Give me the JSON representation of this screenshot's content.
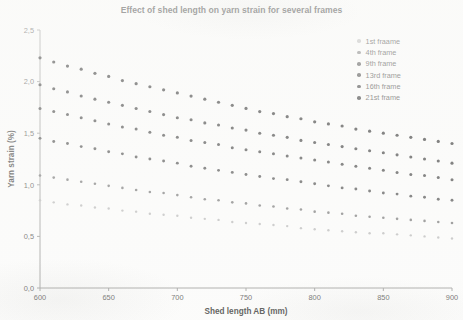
{
  "chart_data": {
    "type": "scatter",
    "title": "Effect of shed length on yarn strain for several frames",
    "xlabel": "Shed length AB (mm)",
    "ylabel": "Yarn strain (%)",
    "xlim": [
      600,
      900
    ],
    "ylim": [
      0.0,
      2.5
    ],
    "xticks": [
      "600",
      "650",
      "700",
      "750",
      "800",
      "850",
      "900"
    ],
    "xtick_values": [
      600,
      650,
      700,
      750,
      800,
      850,
      900
    ],
    "yticks": [
      "0,0",
      "0,5",
      "1,0",
      "1,5",
      "2,0",
      "2,5"
    ],
    "ytick_values": [
      0.0,
      0.5,
      1.0,
      1.5,
      2.0,
      2.5
    ],
    "grid": false,
    "legend_position": "top-right",
    "decimal_separator": ",",
    "marker": "circle",
    "x": [
      600,
      610,
      620,
      630,
      640,
      650,
      660,
      670,
      680,
      690,
      700,
      710,
      720,
      730,
      740,
      750,
      760,
      770,
      780,
      790,
      800,
      810,
      820,
      830,
      840,
      850,
      860,
      870,
      880,
      890,
      900
    ],
    "series": [
      {
        "name": "21st frame",
        "color": "#2a2a2a",
        "marker_size": 3.2,
        "values": [
          2.23,
          2.19,
          2.15,
          2.12,
          2.08,
          2.05,
          2.01,
          1.98,
          1.95,
          1.92,
          1.89,
          1.86,
          1.83,
          1.8,
          1.77,
          1.74,
          1.71,
          1.69,
          1.66,
          1.64,
          1.61,
          1.59,
          1.57,
          1.54,
          1.52,
          1.5,
          1.48,
          1.46,
          1.44,
          1.42,
          1.4
        ]
      },
      {
        "name": "16th frame",
        "color": "#343434",
        "marker_size": 3.1,
        "values": [
          1.97,
          1.93,
          1.9,
          1.86,
          1.83,
          1.8,
          1.77,
          1.74,
          1.71,
          1.68,
          1.65,
          1.63,
          1.6,
          1.58,
          1.55,
          1.53,
          1.5,
          1.48,
          1.46,
          1.43,
          1.41,
          1.39,
          1.37,
          1.35,
          1.33,
          1.31,
          1.29,
          1.27,
          1.25,
          1.23,
          1.21
        ]
      },
      {
        "name": "13rd frame",
        "color": "#3d3d3d",
        "marker_size": 3.0,
        "values": [
          1.74,
          1.71,
          1.68,
          1.65,
          1.62,
          1.59,
          1.56,
          1.54,
          1.51,
          1.48,
          1.46,
          1.43,
          1.41,
          1.39,
          1.36,
          1.34,
          1.32,
          1.3,
          1.28,
          1.26,
          1.24,
          1.22,
          1.2,
          1.18,
          1.16,
          1.14,
          1.12,
          1.1,
          1.09,
          1.07,
          1.05
        ]
      },
      {
        "name": "9th frame",
        "color": "#4a4a4a",
        "marker_size": 2.9,
        "values": [
          1.45,
          1.42,
          1.4,
          1.37,
          1.35,
          1.32,
          1.3,
          1.27,
          1.25,
          1.23,
          1.21,
          1.18,
          1.16,
          1.14,
          1.12,
          1.1,
          1.08,
          1.06,
          1.05,
          1.03,
          1.01,
          0.99,
          0.97,
          0.96,
          0.94,
          0.92,
          0.91,
          0.89,
          0.88,
          0.86,
          0.85
        ]
      },
      {
        "name": "4th frame",
        "color": "#777777",
        "marker_size": 2.6,
        "values": [
          1.09,
          1.07,
          1.05,
          1.03,
          1.01,
          0.99,
          0.97,
          0.95,
          0.93,
          0.92,
          0.9,
          0.88,
          0.86,
          0.85,
          0.83,
          0.82,
          0.8,
          0.79,
          0.77,
          0.76,
          0.74,
          0.73,
          0.72,
          0.7,
          0.69,
          0.68,
          0.67,
          0.66,
          0.65,
          0.64,
          0.63
        ]
      },
      {
        "name": "1st fraame",
        "color": "#b9b9b9",
        "marker_size": 2.4,
        "values": [
          0.85,
          0.83,
          0.81,
          0.8,
          0.78,
          0.77,
          0.75,
          0.74,
          0.72,
          0.71,
          0.7,
          0.68,
          0.67,
          0.66,
          0.64,
          0.63,
          0.62,
          0.61,
          0.6,
          0.58,
          0.57,
          0.56,
          0.55,
          0.54,
          0.53,
          0.53,
          0.52,
          0.51,
          0.5,
          0.49,
          0.48
        ]
      }
    ]
  },
  "legend": {
    "items": [
      {
        "label": "1st fraame",
        "color": "#b9b9b9"
      },
      {
        "label": "4th frame",
        "color": "#777777"
      },
      {
        "label": "9th frame",
        "color": "#4a4a4a"
      },
      {
        "label": "13rd frame",
        "color": "#3d3d3d"
      },
      {
        "label": "16th frame",
        "color": "#343434"
      },
      {
        "label": "21st frame",
        "color": "#2a2a2a"
      }
    ]
  },
  "axes": {
    "axis_color": "#9a9a98",
    "text_color": "#555552"
  }
}
